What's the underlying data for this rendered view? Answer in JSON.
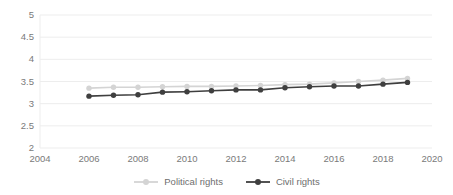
{
  "chart_data": {
    "type": "line",
    "title": "",
    "xlabel": "",
    "ylabel": "",
    "x": [
      2006,
      2007,
      2008,
      2009,
      2010,
      2011,
      2012,
      2013,
      2014,
      2015,
      2016,
      2017,
      2018,
      2019
    ],
    "xlim": [
      2004,
      2020
    ],
    "ylim": [
      2,
      5
    ],
    "xticks": [
      "2004",
      "2006",
      "2008",
      "2010",
      "2012",
      "2014",
      "2016",
      "2018",
      "2020"
    ],
    "xtick_values": [
      2004,
      2006,
      2008,
      2010,
      2012,
      2014,
      2016,
      2018,
      2020
    ],
    "yticks": [
      "2",
      "2.5",
      "3",
      "3.5",
      "4",
      "4.5",
      "5"
    ],
    "ytick_values": [
      2,
      2.5,
      3,
      3.5,
      4,
      4.5,
      5
    ],
    "grid": "horizontal",
    "legend_position": "bottom",
    "series": [
      {
        "name": "Political rights",
        "color": "#d4d4d4",
        "marker": "circle",
        "values": [
          3.35,
          3.37,
          3.37,
          3.38,
          3.39,
          3.39,
          3.4,
          3.41,
          3.43,
          3.44,
          3.47,
          3.5,
          3.53,
          3.57
        ]
      },
      {
        "name": "Civil rights",
        "color": "#3f3f3f",
        "marker": "circle",
        "values": [
          3.17,
          3.19,
          3.2,
          3.26,
          3.27,
          3.29,
          3.31,
          3.31,
          3.36,
          3.38,
          3.4,
          3.4,
          3.44,
          3.48
        ]
      }
    ]
  },
  "legend": {
    "items": [
      {
        "label": "Political rights",
        "color": "#d4d4d4"
      },
      {
        "label": "Civil rights",
        "color": "#3f3f3f"
      }
    ]
  },
  "colors": {
    "political_rights": "#d4d4d4",
    "civil_rights": "#3f3f3f",
    "gridline": "#ededed",
    "axis_text": "#7a7a7a",
    "background": "#ffffff"
  }
}
